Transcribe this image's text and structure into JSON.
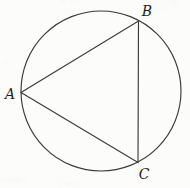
{
  "figure": {
    "kind": "circle-with-inscribed-triangle",
    "colors": {
      "line": "#3a3a3a",
      "label": "#1f1f1f",
      "background": "#fcfcfa"
    },
    "circle": {
      "path": "M 21 91 A 80 80 0 1 0 181 91 A 80 80 0 1 0 21 91"
    },
    "triangle": {
      "points": "21,92.5 138.5,21 138,162.5"
    },
    "vertex_labels": [
      {
        "text": "A",
        "x": "10",
        "y": "99"
      },
      {
        "text": "B",
        "x": "147",
        "y": "16"
      },
      {
        "text": "C",
        "x": "144",
        "y": "179"
      }
    ]
  }
}
